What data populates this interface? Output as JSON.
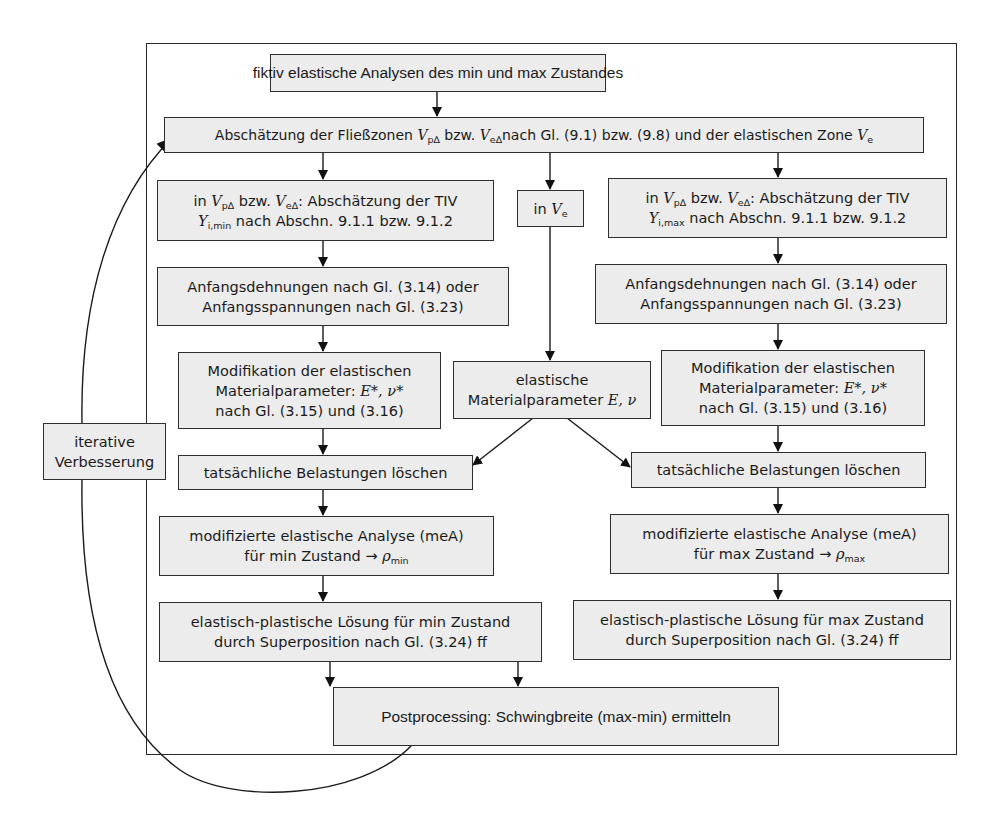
{
  "diagram": {
    "type": "flowchart",
    "language": "de",
    "nodes": {
      "start": {
        "text": "fiktiv elastische Analysen des min und max Zustandes"
      },
      "estimate_zones": {
        "parts": [
          "Abschätzung der Fließzonen ",
          "V",
          "p∆",
          " bzw. ",
          "V",
          "e∆",
          "nach Gl. (9.1) bzw. (9.8) und der elastischen Zone ",
          "V",
          "e"
        ]
      },
      "left_tiv": {
        "line1": [
          "in ",
          "V",
          "p∆",
          " bzw. ",
          "V",
          "e∆",
          ": Abschätzung der TIV"
        ],
        "line2": [
          "Y",
          "i,min",
          " nach Abschn. 9.1.1 bzw. 9.1.2"
        ]
      },
      "mid_ve": {
        "parts": [
          "in ",
          "V",
          "e"
        ]
      },
      "right_tiv": {
        "line1": [
          "in ",
          "V",
          "p∆",
          " bzw. ",
          "V",
          "e∆",
          ": Abschätzung der TIV"
        ],
        "line2": [
          "Y",
          "i,max",
          " nach Abschn. 9.1.1 bzw. 9.1.2"
        ]
      },
      "left_initial": {
        "line1": "Anfangsdehnungen nach Gl. (3.14) oder",
        "line2": "Anfangsspannungen nach Gl. (3.23)"
      },
      "right_initial": {
        "line1": "Anfangsdehnungen nach Gl. (3.14) oder",
        "line2": "Anfangsspannungen nach Gl. (3.23)"
      },
      "left_modify": {
        "line1": "Modifikation der elastischen",
        "line2_prefix": "Materialparameter: ",
        "line2_sym": "E*, ν*",
        "line3": "nach Gl. (3.15) und (3.16)"
      },
      "right_modify": {
        "line1": "Modifikation der elastischen",
        "line2_prefix": "Materialparameter: ",
        "line2_sym": "E*, ν*",
        "line3": "nach Gl. (3.15) und (3.16)"
      },
      "mid_elastic": {
        "line1": "elastische",
        "line2_prefix": "Materialparameter ",
        "line2_sym": "E, ν"
      },
      "left_delete": {
        "text": "tatsächliche Belastungen löschen"
      },
      "right_delete": {
        "text": "tatsächliche Belastungen löschen"
      },
      "left_mea": {
        "line1": "modifizierte elastische Analyse (meA)",
        "line2_prefix": "für min Zustand → ",
        "line2_sym": "ρ",
        "line2_sub": "min"
      },
      "right_mea": {
        "line1": "modifizierte elastische Analyse (meA)",
        "line2_prefix": "für max Zustand → ",
        "line2_sym": "ρ",
        "line2_sub": "max"
      },
      "left_solution": {
        "line1": "elastisch-plastische Lösung für min Zustand",
        "line2": "durch Superposition nach Gl. (3.24) ff"
      },
      "right_solution": {
        "line1": "elastisch-plastische Lösung für max Zustand",
        "line2": "durch Superposition nach Gl. (3.24) ff"
      },
      "post": {
        "text": "Postprocessing: Schwingbreite (max-min) ermitteln"
      },
      "iterate": {
        "line1": "iterative",
        "line2": "Verbesserung"
      }
    },
    "edges": [
      [
        "start",
        "estimate_zones"
      ],
      [
        "estimate_zones",
        "left_tiv"
      ],
      [
        "estimate_zones",
        "mid_ve"
      ],
      [
        "estimate_zones",
        "right_tiv"
      ],
      [
        "left_tiv",
        "left_initial"
      ],
      [
        "left_initial",
        "left_modify"
      ],
      [
        "left_modify",
        "left_delete"
      ],
      [
        "mid_ve",
        "mid_elastic"
      ],
      [
        "mid_elastic",
        "left_delete"
      ],
      [
        "mid_elastic",
        "right_delete"
      ],
      [
        "right_tiv",
        "right_initial"
      ],
      [
        "right_initial",
        "right_modify"
      ],
      [
        "right_modify",
        "right_delete"
      ],
      [
        "left_delete",
        "left_mea"
      ],
      [
        "left_mea",
        "left_solution"
      ],
      [
        "right_delete",
        "right_mea"
      ],
      [
        "right_mea",
        "right_solution"
      ],
      [
        "left_solution",
        "post"
      ],
      [
        "right_solution",
        "post"
      ],
      [
        "post",
        "estimate_zones",
        "iterate"
      ]
    ],
    "colors": {
      "box_fill": "#ececec",
      "stroke": "#2a2a2a",
      "background": "#ffffff"
    }
  }
}
